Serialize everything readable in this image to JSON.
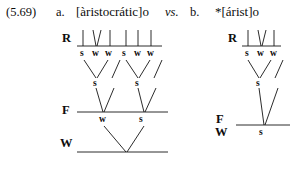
{
  "header": {
    "example_number": "(5.69)",
    "label_a": "a.",
    "form_a": "[àristocrátic]o",
    "vs": "vs.",
    "label_b": "b.",
    "form_b": "*[árist]o"
  },
  "tiers": {
    "r": "R",
    "f": "F",
    "w": "W"
  },
  "part_a": {
    "root_marks": [
      "s",
      "w",
      "w",
      "s",
      "w",
      "w"
    ],
    "foot_level_marks": [
      "s",
      "s"
    ],
    "word_level_marks": [
      "w",
      "s"
    ],
    "tier_labels": {
      "r": "R",
      "f": "F",
      "w": "W"
    }
  },
  "part_b": {
    "root_marks": [
      "s",
      "w",
      "w"
    ],
    "foot_level_marks": [
      "s"
    ],
    "word_level_marks": [
      "s"
    ],
    "tier_labels": {
      "r": "R",
      "f": "F",
      "w": "W"
    }
  },
  "colors": {
    "ink": "#141414",
    "background": "#ffffff"
  }
}
